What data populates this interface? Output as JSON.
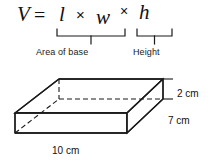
{
  "figure": {
    "background_color": "#ffffff",
    "line_color": "#1a1a1a",
    "formula": {
      "volume_symbol": "V",
      "equals": "=",
      "length_symbol": "l",
      "times_1": "×",
      "width_symbol": "w",
      "times_2": "×",
      "height_symbol": "h",
      "brace_labels": {
        "base": "Area of base",
        "height": "Height"
      }
    },
    "prism": {
      "dimensions": [
        {
          "name": "width",
          "label": "10 cm",
          "value": 10,
          "unit": "cm",
          "edge": "front-bottom"
        },
        {
          "name": "depth",
          "label": "7 cm",
          "value": 7,
          "unit": "cm",
          "edge": "right-bottom-oblique"
        },
        {
          "name": "height",
          "label": "2 cm",
          "value": 2,
          "unit": "cm",
          "edge": "right-vertical"
        }
      ],
      "hidden_edge_style": "dashed",
      "projection": "oblique"
    }
  }
}
